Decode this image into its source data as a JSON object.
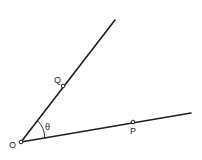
{
  "diagram": {
    "type": "angle",
    "colors": {
      "line": "#1e1e1e",
      "background": "#ffffff",
      "point_fill": "#ffffff"
    },
    "vertex": {
      "label": "O",
      "x": 21,
      "y": 142,
      "label_x": 10,
      "label_y": 148
    },
    "rays": [
      {
        "name": "ray-OQ",
        "end_x": 115,
        "end_y": 20
      },
      {
        "name": "ray-OP",
        "end_x": 191,
        "end_y": 113
      }
    ],
    "points": [
      {
        "label": "Q",
        "x": 63,
        "y": 86,
        "label_x": 55,
        "label_y": 83
      },
      {
        "label": "P",
        "x": 133,
        "y": 122,
        "label_x": 130,
        "label_y": 133
      }
    ],
    "angle": {
      "label": "θ",
      "label_x": 45,
      "label_y": 129,
      "arc_radius": 24
    }
  }
}
